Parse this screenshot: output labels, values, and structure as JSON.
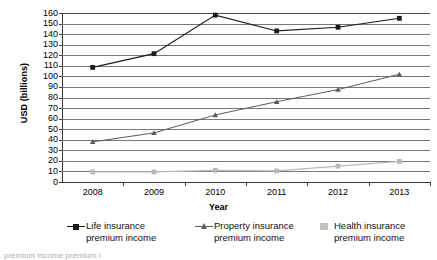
{
  "chart_data": {
    "type": "line",
    "title": "",
    "xlabel": "Year",
    "ylabel": "USD (billions)",
    "categories": [
      "2008",
      "2009",
      "2010",
      "2011",
      "2012",
      "2013"
    ],
    "ylim": [
      0,
      160
    ],
    "ytick_step": 10,
    "yticks": [
      "160",
      "150",
      "140",
      "130",
      "120",
      "110",
      "100",
      "90",
      "80",
      "70",
      "60",
      "50",
      "40",
      "30",
      "20",
      "10",
      "0"
    ],
    "grid": true,
    "grid_axis": "y",
    "legend_position": "bottom",
    "series": [
      {
        "name": "Life insurance\npremium income",
        "marker": "square",
        "color": "#1a1a1a",
        "values": [
          108.5,
          121.5,
          158.0,
          143.0,
          146.5,
          155.0
        ]
      },
      {
        "name": "Property insurance\npremium income",
        "marker": "triangle",
        "color": "#5a5a5a",
        "values": [
          38.0,
          46.5,
          63.5,
          76.0,
          87.5,
          102.0
        ]
      },
      {
        "name": "Health insurance\npremium income",
        "marker": "square",
        "color": "#b9b9b9",
        "values": [
          9.5,
          9.5,
          11.0,
          10.5,
          15.0,
          19.5
        ]
      }
    ]
  },
  "axes": {
    "y_title": "USD (billions)",
    "x_title": "Year"
  },
  "legend": {
    "items": [
      {
        "label": "Life insurance\npremium income",
        "marker": "square-marker",
        "color": "#1a1a1a",
        "has_line": true
      },
      {
        "label": "Property insurance\npremium income",
        "marker": "triangle-marker",
        "color": "#5a5a5a",
        "has_line": true
      },
      {
        "label": "Health insurance\npremium income",
        "marker": "square-marker",
        "color": "#c2c2c2",
        "has_line": false
      }
    ]
  },
  "caption": {
    "clipped_text": "premium income          premium i"
  },
  "colors": {
    "life": "#1a1a1a",
    "property": "#5a5a5a",
    "health": "#b9b9b9",
    "gridline": "#777777",
    "axis": "#3a3a3a"
  }
}
